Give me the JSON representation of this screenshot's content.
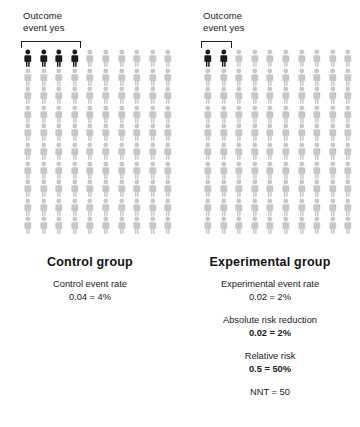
{
  "chart_data": {
    "type": "pictogram",
    "total_per_group": 100,
    "grid": {
      "columns": 10,
      "rows": 10
    },
    "colors": {
      "event": "#1a1a1a",
      "no_event": "#c7c7c7",
      "bracket": "#1f1f1f"
    },
    "groups": [
      {
        "name": "Control group",
        "events": 4,
        "non_events": 96,
        "event_rate_decimal": "0.04",
        "event_rate_percent": "4%"
      },
      {
        "name": "Experimental group",
        "events": 2,
        "non_events": 98,
        "event_rate_decimal": "0.02",
        "event_rate_percent": "2%"
      }
    ],
    "derived": {
      "absolute_risk_reduction": "0.02 = 2%",
      "relative_risk": "0.5 = 50%",
      "nnt": "NNT = 50"
    }
  },
  "panels": {
    "left": {
      "outcome_label": "Outcome\nevent yes",
      "title": "Control group",
      "stats": [
        {
          "label": "Control event rate",
          "value": "0.04 = 4%",
          "bold": false
        }
      ]
    },
    "right": {
      "outcome_label": "Outcome\nevent yes",
      "title": "Experimental group",
      "stats": [
        {
          "label": "Experimental event rate",
          "value": "0.02 = 2%",
          "bold": false
        },
        {
          "label": "Absolute risk reduction",
          "value": "0.02 = 2%",
          "bold": true
        },
        {
          "label": "Relative risk",
          "value": "0.5 = 50%",
          "bold": true
        },
        {
          "label": "NNT = 50",
          "value": "",
          "bold": false
        }
      ]
    }
  }
}
